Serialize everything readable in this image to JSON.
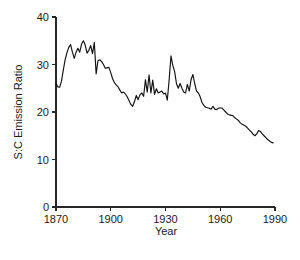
{
  "chart_data": {
    "type": "line",
    "title": "",
    "xlabel": "Year",
    "ylabel": "S:C Emission Ratio",
    "xlim": [
      1870,
      1990
    ],
    "ylim": [
      0,
      40
    ],
    "grid": false,
    "legend": "none",
    "xticks": [
      1870,
      1900,
      1930,
      1960,
      1990
    ],
    "yticks": [
      0,
      10,
      20,
      30,
      40
    ],
    "series": [
      {
        "name": "S:C Emission Ratio",
        "color": "#111111",
        "x": [
          1870,
          1871,
          1872,
          1873,
          1874,
          1875,
          1876,
          1877,
          1878,
          1879,
          1880,
          1881,
          1882,
          1883,
          1884,
          1885,
          1886,
          1887,
          1888,
          1889,
          1890,
          1891,
          1892,
          1893,
          1894,
          1895,
          1896,
          1897,
          1898,
          1899,
          1900,
          1901,
          1902,
          1903,
          1904,
          1905,
          1906,
          1907,
          1908,
          1909,
          1910,
          1911,
          1912,
          1913,
          1914,
          1915,
          1916,
          1917,
          1918,
          1919,
          1920,
          1921,
          1922,
          1923,
          1924,
          1925,
          1926,
          1927,
          1928,
          1929,
          1930,
          1931,
          1932,
          1933,
          1934,
          1935,
          1936,
          1937,
          1938,
          1939,
          1940,
          1941,
          1942,
          1943,
          1944,
          1945,
          1946,
          1947,
          1948,
          1949,
          1950,
          1951,
          1952,
          1953,
          1954,
          1955,
          1956,
          1957,
          1958,
          1959,
          1960,
          1961,
          1962,
          1963,
          1964,
          1965,
          1966,
          1967,
          1968,
          1969,
          1970,
          1971,
          1972,
          1973,
          1974,
          1975,
          1976,
          1977,
          1978,
          1979,
          1980,
          1981,
          1982,
          1983,
          1984,
          1985,
          1986,
          1987,
          1988,
          1989
        ],
        "y": [
          26.0,
          25.3,
          25.2,
          26.5,
          28.8,
          31.0,
          32.5,
          33.6,
          34.2,
          32.6,
          31.3,
          32.6,
          33.4,
          32.6,
          34.3,
          35.0,
          34.1,
          32.4,
          33.0,
          34.0,
          32.3,
          34.6,
          28.0,
          30.8,
          31.0,
          30.6,
          30.0,
          29.2,
          29.3,
          29.4,
          28.3,
          27.0,
          26.2,
          25.7,
          25.3,
          24.6,
          24.0,
          24.2,
          23.8,
          23.2,
          22.4,
          21.6,
          21.2,
          22.2,
          23.5,
          22.6,
          23.6,
          24.0,
          23.3,
          26.8,
          24.2,
          27.8,
          24.0,
          26.7,
          23.7,
          24.9,
          24.0,
          24.2,
          24.4,
          23.8,
          24.0,
          22.5,
          26.8,
          31.8,
          29.8,
          28.5,
          26.0,
          25.0,
          26.0,
          25.0,
          24.2,
          24.0,
          25.8,
          24.4,
          26.8,
          27.9,
          26.0,
          24.4,
          24.0,
          23.2,
          22.0,
          21.4,
          21.0,
          20.9,
          20.8,
          20.6,
          21.2,
          20.6,
          20.5,
          20.8,
          20.9,
          20.8,
          20.4,
          20.0,
          19.6,
          19.4,
          19.3,
          19.2,
          18.8,
          18.5,
          18.2,
          17.7,
          17.4,
          17.2,
          17.0,
          16.6,
          16.2,
          15.8,
          15.3,
          15.0,
          15.4,
          16.1,
          15.9,
          15.4,
          15.0,
          14.6,
          14.2,
          13.9,
          13.6,
          13.5
        ]
      }
    ]
  },
  "axes": {
    "x_tick_labels": [
      "1870",
      "1900",
      "1930",
      "1960",
      "1990"
    ],
    "y_tick_labels": [
      "0",
      "10",
      "20",
      "30",
      "40"
    ],
    "x_axis_title": "Year",
    "y_axis_title": "S:C Emission Ratio"
  }
}
